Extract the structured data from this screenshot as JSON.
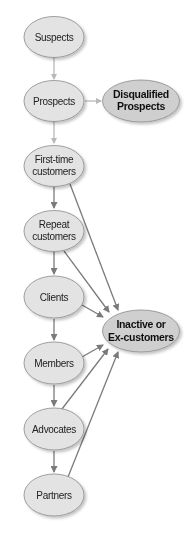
{
  "diagram": {
    "colors": {
      "node_fill": "#e3e3e3",
      "node_fill_dark": "#cfcfcf",
      "node_stroke": "#8a8a8a",
      "edge_light": "#b8b8b8",
      "edge_dark": "#7a7a7a",
      "background": "#ffffff"
    },
    "nodes": {
      "suspects": {
        "lines": [
          "Suspects"
        ]
      },
      "prospects": {
        "lines": [
          "Prospects"
        ]
      },
      "disqualified": {
        "lines": [
          "Disqualified",
          "Prospects"
        ]
      },
      "first_time": {
        "lines": [
          "First-time",
          "customers"
        ]
      },
      "repeat": {
        "lines": [
          "Repeat",
          "customers"
        ]
      },
      "clients": {
        "lines": [
          "Clients"
        ]
      },
      "members": {
        "lines": [
          "Members"
        ]
      },
      "advocates": {
        "lines": [
          "Advocates"
        ]
      },
      "partners": {
        "lines": [
          "Partners"
        ]
      },
      "inactive": {
        "lines": [
          "Inactive or",
          "Ex-customers"
        ]
      }
    },
    "edges": [
      {
        "from": "Suspects",
        "to": "Prospects"
      },
      {
        "from": "Prospects",
        "to": "Disqualified Prospects"
      },
      {
        "from": "Prospects",
        "to": "First-time customers"
      },
      {
        "from": "First-time customers",
        "to": "Repeat customers"
      },
      {
        "from": "Repeat customers",
        "to": "Clients"
      },
      {
        "from": "Clients",
        "to": "Members"
      },
      {
        "from": "Members",
        "to": "Advocates"
      },
      {
        "from": "Advocates",
        "to": "Partners"
      },
      {
        "from": "First-time customers",
        "to": "Inactive or Ex-customers"
      },
      {
        "from": "Repeat customers",
        "to": "Inactive or Ex-customers"
      },
      {
        "from": "Clients",
        "to": "Inactive or Ex-customers"
      },
      {
        "from": "Members",
        "to": "Inactive or Ex-customers"
      },
      {
        "from": "Advocates",
        "to": "Inactive or Ex-customers"
      },
      {
        "from": "Partners",
        "to": "Inactive or Ex-customers"
      }
    ]
  }
}
